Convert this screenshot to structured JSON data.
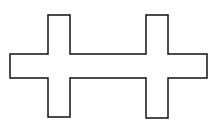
{
  "diagram": {
    "title": "",
    "shape_name": "double-cross-outline",
    "stroke_color": "#111111",
    "fill_color": "#ffffff",
    "stroke_width": 1.5,
    "points": "10,54 48,54 48,15 70,15 70,54 146,54 146,15 168,15 168,54 207,54 207,78 168,78 168,118 146,118 146,78 70,78 70,117 48,117 48,78 10,78"
  }
}
